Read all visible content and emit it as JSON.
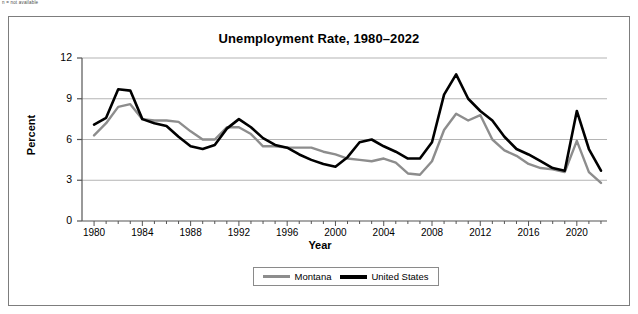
{
  "footnote": "n = not available",
  "chart_data": {
    "type": "line",
    "title": "Unemployment Rate, 1980–2022",
    "xlabel": "Year",
    "ylabel": "Percent",
    "xlim": [
      1979,
      2022.5
    ],
    "ylim": [
      0,
      12
    ],
    "yticks": [
      0,
      3,
      6,
      9,
      12
    ],
    "xticks": [
      1980,
      1984,
      1988,
      1992,
      1996,
      2000,
      2004,
      2008,
      2012,
      2016,
      2020
    ],
    "grid": "horizontal",
    "legend_position": "bottom-center",
    "x": [
      1980,
      1981,
      1982,
      1983,
      1984,
      1985,
      1986,
      1987,
      1988,
      1989,
      1990,
      1991,
      1992,
      1993,
      1994,
      1995,
      1996,
      1997,
      1998,
      1999,
      2000,
      2001,
      2002,
      2003,
      2004,
      2005,
      2006,
      2007,
      2008,
      2009,
      2010,
      2011,
      2012,
      2013,
      2014,
      2015,
      2016,
      2017,
      2018,
      2019,
      2020,
      2021,
      2022
    ],
    "series": [
      {
        "name": "Montana",
        "color": "#8d8d8d",
        "values": [
          6.3,
          7.2,
          8.4,
          8.6,
          7.5,
          7.4,
          7.4,
          7.3,
          6.6,
          6.0,
          6.0,
          6.9,
          6.9,
          6.4,
          5.5,
          5.5,
          5.4,
          5.4,
          5.4,
          5.1,
          4.9,
          4.6,
          4.5,
          4.4,
          4.6,
          4.3,
          3.5,
          3.4,
          4.4,
          6.7,
          7.9,
          7.4,
          7.8,
          6.0,
          5.2,
          4.8,
          4.2,
          3.9,
          3.8,
          3.6,
          5.9,
          3.6,
          2.8
        ]
      },
      {
        "name": "United States",
        "color": "#000000",
        "values": [
          7.1,
          7.6,
          9.7,
          9.6,
          7.5,
          7.2,
          7.0,
          6.2,
          5.5,
          5.3,
          5.6,
          6.8,
          7.5,
          6.9,
          6.1,
          5.6,
          5.4,
          4.9,
          4.5,
          4.2,
          4.0,
          4.7,
          5.8,
          6.0,
          5.5,
          5.1,
          4.6,
          4.6,
          5.8,
          9.3,
          10.8,
          9.0,
          8.1,
          7.4,
          6.2,
          5.3,
          4.9,
          4.4,
          3.9,
          3.7,
          8.1,
          5.3,
          3.7
        ]
      }
    ]
  }
}
